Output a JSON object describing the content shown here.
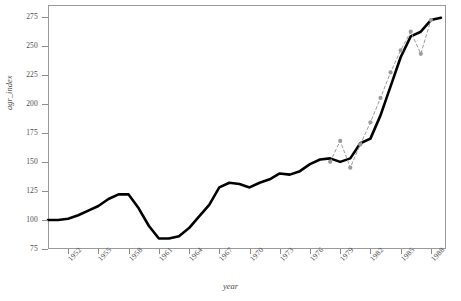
{
  "chart_data": {
    "type": "line",
    "title": "",
    "xlabel": "year",
    "ylabel": "agr_index",
    "xlim": [
      1950,
      1989.5
    ],
    "ylim": [
      75,
      285
    ],
    "grid": false,
    "legend": "none",
    "ytick_values": [
      75,
      100,
      125,
      150,
      175,
      200,
      225,
      250,
      275
    ],
    "xtick_values": [
      1952,
      1955,
      1958,
      1961,
      1964,
      1967,
      1970,
      1973,
      1976,
      1979,
      1982,
      1985,
      1988
    ],
    "xtick_labels": [
      "1952",
      "1955",
      "1958",
      "1961",
      "1964",
      "1967",
      "1970",
      "1973",
      "1976",
      "1979",
      "1982",
      "1985",
      "1988"
    ],
    "series": [
      {
        "name": "agr_index",
        "style": "solid",
        "color": "#000000",
        "width": 2.6,
        "marker": "none",
        "x": [
          1950,
          1951,
          1952,
          1953,
          1954,
          1955,
          1956,
          1957,
          1958,
          1959,
          1960,
          1961,
          1962,
          1963,
          1964,
          1965,
          1966,
          1967,
          1968,
          1969,
          1970,
          1971,
          1972,
          1973,
          1974,
          1975,
          1976,
          1977,
          1978,
          1979,
          1980,
          1981,
          1982,
          1983,
          1984,
          1985,
          1986,
          1987,
          1988,
          1989
        ],
        "y": [
          100,
          100,
          101,
          104,
          108,
          112,
          118,
          122,
          122,
          110,
          95,
          84,
          84,
          86,
          93,
          103,
          113,
          128,
          132,
          131,
          128,
          132,
          135,
          140,
          139,
          142,
          148,
          152,
          153,
          150,
          153,
          166,
          170,
          190,
          215,
          240,
          258,
          262,
          272,
          274
        ]
      },
      {
        "name": "fitted",
        "style": "dashed",
        "color": "#9b9b9b",
        "width": 1,
        "marker": "circle",
        "marker_size": 4.2,
        "x": [
          1978,
          1979,
          1980,
          1981,
          1982,
          1983,
          1984,
          1985,
          1986,
          1987,
          1988
        ],
        "y": [
          150,
          168,
          145,
          165,
          184,
          205,
          227,
          246,
          262,
          243,
          272
        ]
      }
    ]
  }
}
